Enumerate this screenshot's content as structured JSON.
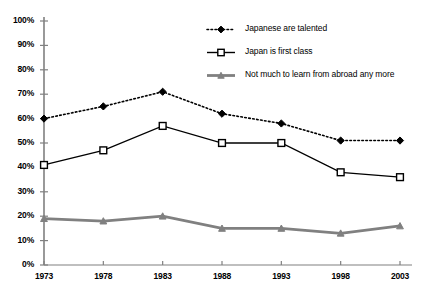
{
  "chart_data": {
    "type": "line",
    "title": "",
    "xlabel": "",
    "ylabel": "",
    "categories": [
      "1973",
      "1978",
      "1983",
      "1988",
      "1993",
      "1998",
      "2003"
    ],
    "x": [
      1973,
      1978,
      1983,
      1988,
      1993,
      1998,
      2003
    ],
    "ylim": [
      0,
      100
    ],
    "yticks": [
      "0%",
      "10%",
      "20%",
      "30%",
      "40%",
      "50%",
      "60%",
      "70%",
      "80%",
      "90%",
      "100%"
    ],
    "ytick_values": [
      0,
      10,
      20,
      30,
      40,
      50,
      60,
      70,
      80,
      90,
      100
    ],
    "grid": false,
    "legend_position": "top-right",
    "value_unit": "percent",
    "series": [
      {
        "name": "Japanese are talented",
        "values": [
          60,
          65,
          71,
          62,
          58,
          51,
          51
        ],
        "marker": "diamond",
        "line_style": "dotted",
        "color": "#000000"
      },
      {
        "name": "Japan is first class",
        "values": [
          41,
          47,
          57,
          50,
          50,
          38,
          36
        ],
        "marker": "square-open",
        "line_style": "solid",
        "color": "#000000"
      },
      {
        "name": "Not much to learn from abroad any more",
        "values": [
          19,
          18,
          20,
          15,
          15,
          13,
          16
        ],
        "marker": "triangle",
        "line_style": "solid",
        "color": "#808080"
      }
    ]
  },
  "axis": {
    "y_axis_color": "#808080",
    "x_axis_color": "#808080"
  },
  "legend": {
    "items": [
      {
        "label": "Japanese are talented"
      },
      {
        "label": "Japan is first class"
      },
      {
        "label": "Not much to learn from abroad any more"
      }
    ]
  }
}
